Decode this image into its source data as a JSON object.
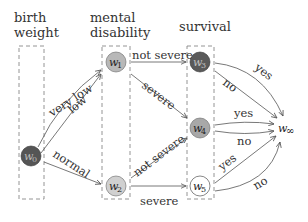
{
  "diagram": {
    "columns": [
      {
        "id": "birth_weight",
        "line1": "birth",
        "line2": "weight"
      },
      {
        "id": "mental_disability",
        "line1": "mental",
        "line2": "disability"
      },
      {
        "id": "survival",
        "line1": "survival",
        "line2": ""
      }
    ],
    "nodes": [
      {
        "id": "w0",
        "base": "w",
        "sub": "0",
        "fill": "#555555",
        "column": "birth_weight"
      },
      {
        "id": "w1",
        "base": "w",
        "sub": "1",
        "fill": "#b8b8b8",
        "column": "mental_disability"
      },
      {
        "id": "w2",
        "base": "w",
        "sub": "2",
        "fill": "#d0d0d0",
        "column": "mental_disability"
      },
      {
        "id": "w3",
        "base": "w",
        "sub": "3",
        "fill": "#5a5a5a",
        "column": "survival"
      },
      {
        "id": "w4",
        "base": "w",
        "sub": "4",
        "fill": "#a8a8a8",
        "column": "survival"
      },
      {
        "id": "w5",
        "base": "w",
        "sub": "5",
        "fill": "#ffffff",
        "column": "survival"
      },
      {
        "id": "winf",
        "base": "w",
        "sub": "∞",
        "fill": "none",
        "column": ""
      }
    ],
    "edges": [
      {
        "from": "w0",
        "to": "w1",
        "label": "very low"
      },
      {
        "from": "w0",
        "to": "w1",
        "label": "low"
      },
      {
        "from": "w0",
        "to": "w2",
        "label": "normal"
      },
      {
        "from": "w1",
        "to": "w3",
        "label": "not severe"
      },
      {
        "from": "w1",
        "to": "w4",
        "label": "severe"
      },
      {
        "from": "w2",
        "to": "w4",
        "label": "not severe"
      },
      {
        "from": "w2",
        "to": "w5",
        "label": "severe"
      },
      {
        "from": "w3",
        "to": "winf",
        "label": "yes"
      },
      {
        "from": "w3",
        "to": "winf",
        "label": "no"
      },
      {
        "from": "w4",
        "to": "winf",
        "label": "yes"
      },
      {
        "from": "w4",
        "to": "winf",
        "label": "no"
      },
      {
        "from": "w5",
        "to": "winf",
        "label": "yes"
      },
      {
        "from": "w5",
        "to": "winf",
        "label": "no"
      }
    ]
  }
}
